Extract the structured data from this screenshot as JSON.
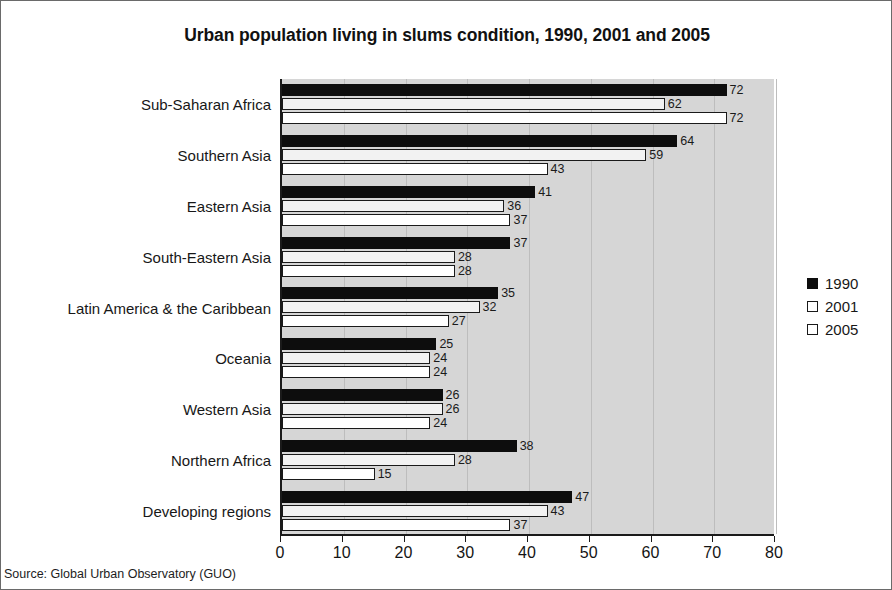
{
  "chart_data": {
    "type": "bar",
    "orientation": "horizontal",
    "title": "Urban population living in slums condition, 1990, 2001 and 2005",
    "xlabel": "",
    "ylabel": "",
    "xlim": [
      0,
      80
    ],
    "xticks": [
      0,
      10,
      20,
      30,
      40,
      50,
      60,
      70,
      80
    ],
    "grid": true,
    "legend_position": "right",
    "categories": [
      "Sub-Saharan Africa",
      "Southern Asia",
      "Eastern Asia",
      "South-Eastern Asia",
      "Latin America & the Caribbean",
      "Oceania",
      "Western Asia",
      "Northern Africa",
      "Developing regions"
    ],
    "series": [
      {
        "name": "1990",
        "color": "#0d0d0d",
        "values": [
          72,
          64,
          41,
          37,
          35,
          25,
          26,
          38,
          47
        ]
      },
      {
        "name": "2001",
        "color": "#ffffff",
        "values": [
          62,
          59,
          36,
          28,
          32,
          24,
          26,
          28,
          43
        ]
      },
      {
        "name": "2005",
        "color": "#ffffff",
        "values": [
          72,
          43,
          37,
          28,
          27,
          24,
          24,
          15,
          37
        ]
      }
    ]
  },
  "source": {
    "text": "Source: Global Urban Observatory (GUO)"
  }
}
